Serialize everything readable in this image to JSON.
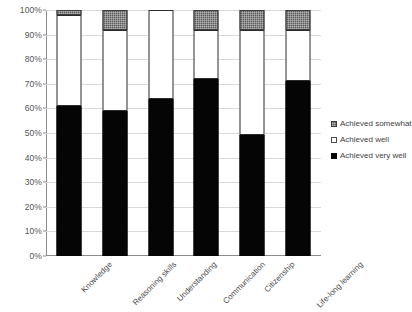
{
  "chart_data": {
    "type": "bar",
    "subtype": "stacked-100-percent",
    "title": "",
    "xlabel": "",
    "ylabel": "",
    "ylim": [
      0,
      100
    ],
    "ytick_labels": [
      "0%",
      "10%",
      "20%",
      "30%",
      "40%",
      "50%",
      "60%",
      "70%",
      "80%",
      "90%",
      "100%"
    ],
    "ytick_values": [
      0,
      10,
      20,
      30,
      40,
      50,
      60,
      70,
      80,
      90,
      100
    ],
    "grid": true,
    "legend_position": "right",
    "categories": [
      "Knowledge",
      "Reasoning skills",
      "Understanding",
      "Communication",
      "Citizenship",
      "Life-long learning"
    ],
    "series": [
      {
        "name": "Achieved very well",
        "color": "#050505",
        "values": [
          61,
          59,
          64,
          72,
          49,
          71
        ]
      },
      {
        "name": "Achieved well",
        "color": "#ffffff",
        "values": [
          37,
          33,
          36,
          20,
          43,
          21
        ]
      },
      {
        "name": "Achieved somewhat",
        "color": "#5c5c5c",
        "values": [
          2,
          8,
          0,
          8,
          8,
          8
        ]
      }
    ]
  },
  "legend": {
    "items": [
      {
        "label": "Achieved somewhat",
        "swatch": "somewhat"
      },
      {
        "label": "Achieved well",
        "swatch": "well"
      },
      {
        "label": "Achieved very well",
        "swatch": "verywell"
      }
    ]
  }
}
